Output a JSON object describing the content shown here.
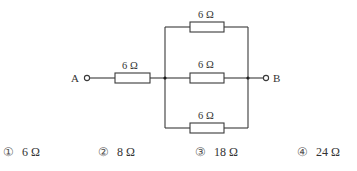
{
  "diagram": {
    "type": "circuit",
    "terminals": [
      {
        "id": "A",
        "label": "A"
      },
      {
        "id": "B",
        "label": "B"
      }
    ],
    "resistors": [
      {
        "id": "R_series",
        "label": "6 Ω",
        "position": "series, between A and parallel block"
      },
      {
        "id": "R_top",
        "label": "6 Ω",
        "position": "parallel branch top"
      },
      {
        "id": "R_mid",
        "label": "6 Ω",
        "position": "parallel branch middle"
      },
      {
        "id": "R_bot",
        "label": "6 Ω",
        "position": "parallel branch bottom"
      }
    ]
  },
  "choices": [
    {
      "num": "①",
      "value": "6 Ω"
    },
    {
      "num": "②",
      "value": "8 Ω"
    },
    {
      "num": "③",
      "value": "18 Ω"
    },
    {
      "num": "④",
      "value": "24 Ω"
    }
  ]
}
